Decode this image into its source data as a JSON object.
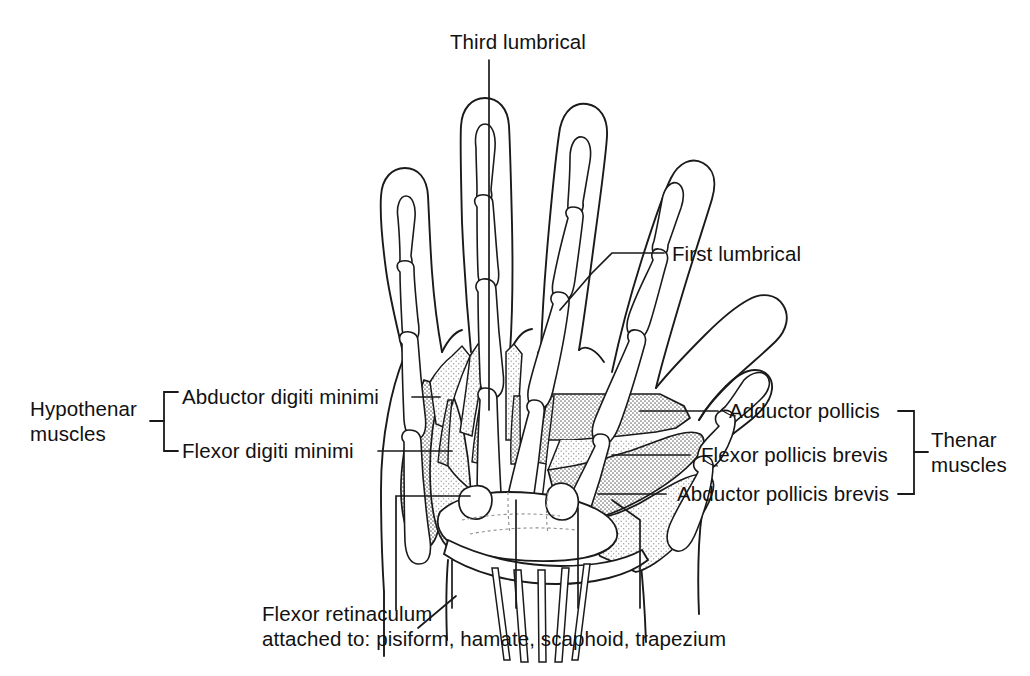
{
  "figure": {
    "type": "anatomical-line-diagram",
    "background_color": "#ffffff",
    "ink_color": "#111111",
    "muscle_fill_color": "#b9b9b9",
    "muscle_fill_light": "#d8d8d8"
  },
  "labels": {
    "third_lumbrical": "Third lumbrical",
    "first_lumbrical": "First lumbrical",
    "abductor_digiti_minimi": "Abductor digiti minimi",
    "flexor_digiti_minimi": "Flexor digiti minimi",
    "hypothenar_muscles": "Hypothenar\nmuscles",
    "adductor_pollicis": "Adductor pollicis",
    "flexor_pollicis_brevis": "Flexor pollicis brevis",
    "abductor_pollicis_brevis": "Abductor pollicis brevis",
    "thenar_muscles": "Thenar\nmuscles",
    "flexor_retinaculum_line1": "Flexor retinaculum",
    "flexor_retinaculum_line2": "attached to: pisiform, hamate, scaphoid, trapezium"
  },
  "groups": {
    "hypothenar": {
      "name": "Hypothenar muscles",
      "members": [
        "Abductor digiti minimi",
        "Flexor digiti minimi"
      ],
      "bracket_side": "left"
    },
    "thenar": {
      "name": "Thenar muscles",
      "members": [
        "Adductor pollicis",
        "Flexor pollicis brevis",
        "Abductor pollicis brevis"
      ],
      "bracket_side": "right"
    }
  },
  "retinaculum_attachments": [
    "pisiform",
    "hamate",
    "scaphoid",
    "trapezium"
  ]
}
